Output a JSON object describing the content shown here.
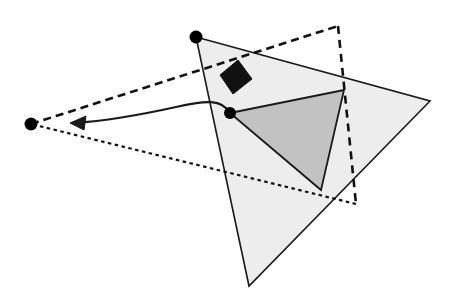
{
  "figure": {
    "canvas": {
      "width": 456,
      "height": 296,
      "background": "#ffffff"
    },
    "colors": {
      "stroke": "#1a1a1a",
      "outer_triangle_fill": "#ededed",
      "inner_triangle_fill": "#c2c2c2",
      "black_quad_fill": "#111111",
      "dot_fill": "#000000",
      "white": "#ffffff"
    },
    "shapes": {
      "outer_triangle": {
        "name": "outer-light-triangle",
        "points": "196,37 430,101 249,286",
        "fill": "#ededed",
        "stroke": "#1a1a1a",
        "stroke_width": 1.6
      },
      "inner_triangle": {
        "name": "inner-gray-triangle",
        "points": "230,113 344,90 321,190",
        "fill": "#c2c2c2",
        "stroke": "#1a1a1a",
        "stroke_width": 1.8
      },
      "dashed_triangle": {
        "name": "dashed-triangle",
        "points": "31,124 338,26 356,204",
        "stroke": "#111111",
        "fill": "none",
        "edges": [
          {
            "name": "dashed-edge-upper",
            "from": "31,124",
            "to": "338,26",
            "dash": "8,5",
            "width": 2.6
          },
          {
            "name": "dashed-edge-right",
            "from": "338,26",
            "to": "356,204",
            "dash": "8,6",
            "width": 2.6
          },
          {
            "name": "dashed-edge-lower",
            "from": "356,204",
            "to": "31,124",
            "dash": "3.5,3.5",
            "width": 2.2
          }
        ]
      },
      "black_quad": {
        "name": "black-parallelogram",
        "points": "220,75 238,60 252,79 233,94",
        "fill": "#111111",
        "stroke": "#111111",
        "stroke_width": 1
      }
    },
    "arrow": {
      "name": "curved-motion-arrow",
      "path": "M 230,113 C 222,99 206,100 176,107 C 140,115 104,121 74,123",
      "stroke": "#1a1a1a",
      "stroke_width": 2.2,
      "head": {
        "name": "arrowhead",
        "points": "70,123 86,116 84,130"
      },
      "from_label": "inner vertex",
      "to_label": "left apex"
    },
    "points": [
      {
        "name": "vertex-dot-top",
        "cx": 196,
        "cy": 37,
        "r": 6.5,
        "fill": "#000000"
      },
      {
        "name": "vertex-dot-left",
        "cx": 31,
        "cy": 124,
        "r": 6.5,
        "fill": "#000000"
      },
      {
        "name": "vertex-dot-inner",
        "cx": 230,
        "cy": 113,
        "r": 6.0,
        "fill": "#000000"
      }
    ]
  }
}
